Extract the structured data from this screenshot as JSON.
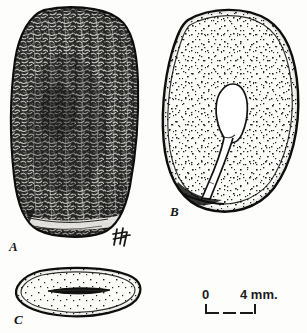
{
  "plate": {
    "kind": "botanical-seed-plate",
    "caption_style": "italic-letters",
    "background_color": "#fdfdfc",
    "ink_color": "#141414"
  },
  "figures": [
    {
      "key": "A",
      "label": "A",
      "view": "external view of whole seed",
      "rendering": "dense scribbled / rugose shading",
      "fill_color": "#3a3a38"
    },
    {
      "key": "B",
      "label": "B",
      "view": "longitudinal section showing embryo in endosperm",
      "rendering": "stippled endosperm with outlined embryo",
      "fill_color": "#fbfbf9"
    },
    {
      "key": "C",
      "label": "C",
      "view": "transverse section of seed",
      "rendering": "stippled section with dark central slit",
      "fill_color": "#fbfbf9"
    }
  ],
  "monogram": {
    "name": "artist-monogram",
    "text": "Hf"
  },
  "scale_bar": {
    "name": "scale-bar",
    "start_label": "0",
    "end_label": "4 mm.",
    "unit": "mm",
    "span_value": 4
  }
}
